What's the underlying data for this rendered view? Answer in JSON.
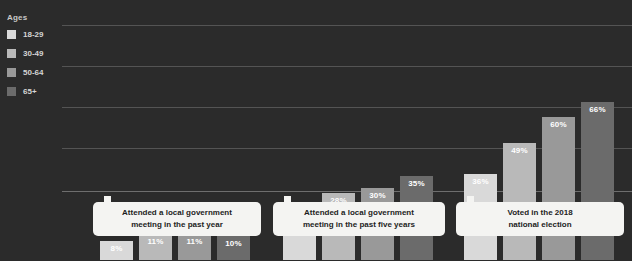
{
  "legend": {
    "title": "Ages",
    "items": [
      {
        "label": "18-29",
        "color": "#d9d9d9"
      },
      {
        "label": "30-49",
        "color": "#b9b9b9"
      },
      {
        "label": "50-64",
        "color": "#999999"
      },
      {
        "label": "65+",
        "color": "#6b6b6b"
      }
    ]
  },
  "chart_data": {
    "type": "bar",
    "title": "",
    "xlabel": "",
    "ylabel": "",
    "ylim": [
      0,
      80
    ],
    "grid": true,
    "legend_position": "left",
    "categories": [
      "Attended a local government meeting in the past year",
      "Attended a local government meeting in the past five years",
      "Voted in the 2018 national election"
    ],
    "series": [
      {
        "name": "18-29",
        "color": "#d9d9d9",
        "values": [
          8,
          23,
          36
        ],
        "labels": [
          "8%",
          "23%",
          "36%"
        ]
      },
      {
        "name": "30-49",
        "color": "#b9b9b9",
        "values": [
          11,
          28,
          49
        ],
        "labels": [
          "11%",
          "28%",
          "49%"
        ]
      },
      {
        "name": "50-64",
        "color": "#999999",
        "values": [
          11,
          30,
          60
        ],
        "labels": [
          "11%",
          "30%",
          "60%"
        ]
      },
      {
        "name": "65+",
        "color": "#6b6b6b",
        "values": [
          10,
          35,
          66
        ],
        "labels": [
          "10%",
          "35%",
          "66%"
        ]
      }
    ]
  },
  "callouts": [
    {
      "line1": "Attended a local government",
      "line2": "meeting in the past year"
    },
    {
      "line1": "Attended a local government",
      "line2": "meeting in the past five years"
    },
    {
      "line1": "Voted in the 2018",
      "line2": "national election"
    }
  ],
  "colors": {
    "background": "#2b2b2b",
    "gridline": "#545454",
    "baseline": "#6e6e6e",
    "callout_bg": "#f4f4f2",
    "callout_text": "#1d1d1d",
    "label_text": "#ffffff"
  }
}
